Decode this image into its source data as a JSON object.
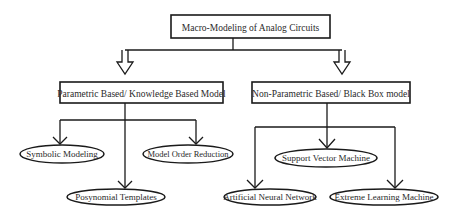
{
  "diagram": {
    "root": {
      "label": "Macro-Modeling of Analog Circuits"
    },
    "branches": [
      {
        "label": "Parametric Based/ Knowledge Based Model",
        "children": [
          {
            "label": "Symbolic Modeling"
          },
          {
            "label": "Model Order Reduction"
          },
          {
            "label": "Posynomial Templates"
          }
        ]
      },
      {
        "label": "Non-Parametric Based/ Black Box model",
        "children": [
          {
            "label": "Support Vector Machine"
          },
          {
            "label": "Artificial Neural Network"
          },
          {
            "label": "Extreme Learning Machine"
          }
        ]
      }
    ],
    "colors": {
      "stroke": "#1a1a1a",
      "text": "#2a2a2a",
      "background": "#ffffff"
    }
  }
}
